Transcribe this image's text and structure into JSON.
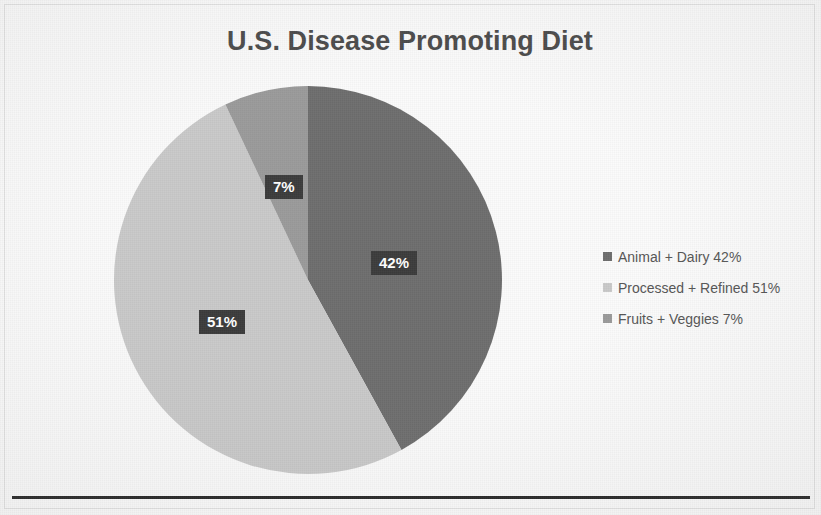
{
  "chart_data": {
    "type": "pie",
    "title": "U.S. Disease Promoting Diet",
    "categories": [
      "Animal + Dairy",
      "Processed + Refined",
      "Fruits + Veggies"
    ],
    "values": [
      42,
      51,
      7
    ],
    "value_labels": [
      "42%",
      "51%",
      "7%"
    ],
    "legend_labels": [
      "Animal + Dairy 42%",
      "Processed + Refined 51%",
      "Fruits + Veggies 7%"
    ],
    "colors": [
      "#6e6e6e",
      "#c9c9c9",
      "#9a9a9a"
    ],
    "legend_position": "right",
    "start_angle_deg": 0,
    "direction": "clockwise",
    "units": "percent",
    "xlabel": "",
    "ylabel": ""
  },
  "title": {
    "text": "U.S. Disease Promoting Diet",
    "color": "#4a4a4a"
  },
  "slices": [
    {
      "label": "42%",
      "name": "Animal + Dairy",
      "value": 42,
      "color": "#6e6e6e"
    },
    {
      "label": "51%",
      "name": "Processed + Refined",
      "value": 51,
      "color": "#c9c9c9"
    },
    {
      "label": "7%",
      "name": "Fruits + Veggies",
      "value": 7,
      "color": "#9a9a9a"
    }
  ],
  "legend": {
    "items": [
      {
        "label": "Animal + Dairy 42%",
        "color": "#6e6e6e"
      },
      {
        "label": "Processed + Refined 51%",
        "color": "#c9c9c9"
      },
      {
        "label": "Fruits + Veggies 7%",
        "color": "#9a9a9a"
      }
    ]
  },
  "label_box": {
    "background": "#3c3c3c",
    "text_color": "#ffffff"
  },
  "divider": {
    "color": "#262626"
  }
}
